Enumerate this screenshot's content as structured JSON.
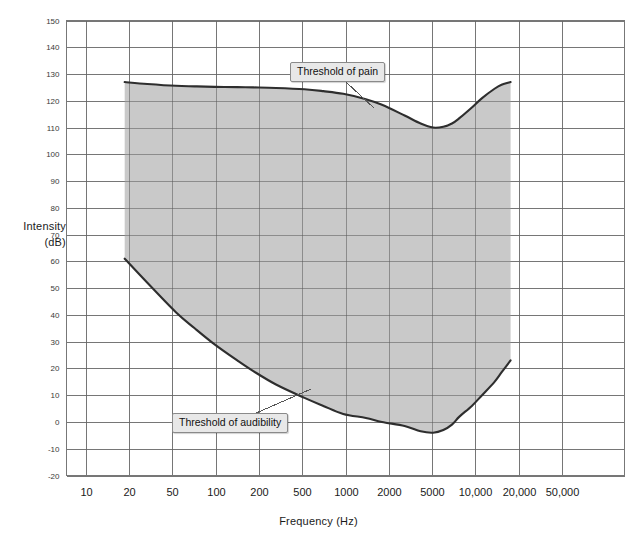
{
  "chart_data": {
    "type": "area",
    "title": "",
    "xlabel": "Frequency  (Hz)",
    "ylabel_line1": "Intensity",
    "ylabel_line2": "(dB)",
    "xscale": "log",
    "x_tick_labels": [
      "10",
      "20",
      "50",
      "100",
      "200",
      "500",
      "1000",
      "2000",
      "5000",
      "10,000",
      "20,000",
      "50,000"
    ],
    "x_tick_values": [
      10,
      20,
      50,
      100,
      200,
      500,
      1000,
      2000,
      5000,
      10000,
      20000,
      50000
    ],
    "y_tick_labels": [
      "150",
      "140",
      "130",
      "120",
      "110",
      "100",
      "90",
      "80",
      "70",
      "60",
      "50",
      "40",
      "30",
      "20",
      "10",
      "0",
      "-10",
      "-20"
    ],
    "y_tick_values": [
      150,
      140,
      130,
      120,
      110,
      100,
      90,
      80,
      70,
      60,
      50,
      40,
      30,
      20,
      10,
      0,
      -10,
      -20
    ],
    "ylim": [
      -20,
      150
    ],
    "xlim": [
      10,
      50000
    ],
    "grid": true,
    "legend_position": "none",
    "annotations": [
      {
        "name": "threshold-of-pain",
        "text": "Threshold of pain",
        "box_x": 290,
        "box_y": 62,
        "leader_to_x": 374,
        "leader_to_y": 108
      },
      {
        "name": "threshold-of-audibility",
        "text": "Threshold of audibility",
        "box_x": 172,
        "box_y": 413,
        "leader_to_x": 311,
        "leader_to_y": 389
      }
    ],
    "fill_color": "#c9c9c9",
    "line_color": "#2e2e2e",
    "grid_color": "#9a9a9a",
    "background_color": "#ffffff",
    "series": [
      {
        "name": "Threshold of pain",
        "points": [
          [
            20,
            127
          ],
          [
            30,
            126.3
          ],
          [
            50,
            125.6
          ],
          [
            70,
            125.4
          ],
          [
            100,
            125.2
          ],
          [
            150,
            125.1
          ],
          [
            200,
            125.0
          ],
          [
            300,
            124.8
          ],
          [
            500,
            124.3
          ],
          [
            700,
            123.6
          ],
          [
            1000,
            122.6
          ],
          [
            1500,
            120.6
          ],
          [
            2000,
            118.5
          ],
          [
            3000,
            114.5
          ],
          [
            4000,
            111.5
          ],
          [
            5000,
            110.0
          ],
          [
            6000,
            110.3
          ],
          [
            7000,
            111.5
          ],
          [
            8000,
            113.5
          ],
          [
            10000,
            117.5
          ],
          [
            12000,
            121.0
          ],
          [
            15000,
            124.5
          ],
          [
            17000,
            126.0
          ],
          [
            20000,
            127.0
          ]
        ]
      },
      {
        "name": "Threshold of audibility",
        "points": [
          [
            20,
            61
          ],
          [
            30,
            52
          ],
          [
            50,
            41
          ],
          [
            70,
            35
          ],
          [
            100,
            29
          ],
          [
            150,
            23
          ],
          [
            200,
            19
          ],
          [
            300,
            14
          ],
          [
            500,
            9
          ],
          [
            700,
            6
          ],
          [
            1000,
            3
          ],
          [
            1500,
            1.5
          ],
          [
            2000,
            0
          ],
          [
            3000,
            -1.5
          ],
          [
            4000,
            -3.5
          ],
          [
            5000,
            -4
          ],
          [
            6000,
            -3
          ],
          [
            7000,
            -1
          ],
          [
            8000,
            2
          ],
          [
            10000,
            6
          ],
          [
            12000,
            10
          ],
          [
            15000,
            15
          ],
          [
            17000,
            18.5
          ],
          [
            20000,
            23
          ]
        ]
      }
    ]
  }
}
